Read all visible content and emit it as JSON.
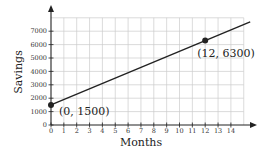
{
  "chart_data": {
    "type": "line",
    "title": "",
    "xlabel": "Months",
    "ylabel": "Savings",
    "xlim": [
      0,
      15
    ],
    "ylim": [
      0,
      8000
    ],
    "x_ticks": [
      0,
      1,
      2,
      3,
      4,
      5,
      6,
      7,
      8,
      9,
      10,
      11,
      12,
      13,
      14
    ],
    "y_ticks": [
      0,
      1000,
      2000,
      3000,
      4000,
      5000,
      6000,
      7000
    ],
    "grid": true,
    "legend": null,
    "series": [
      {
        "name": "Savings",
        "equation": "y = 400x + 1500",
        "x": [
          0,
          15.5
        ],
        "values": [
          1500,
          7700
        ]
      }
    ],
    "points": [
      {
        "x": 0,
        "y": 1500,
        "label": "(0, 1500)"
      },
      {
        "x": 12,
        "y": 6300,
        "label": "(12, 6300)"
      }
    ],
    "colors": {
      "line": "#222222",
      "grid": "#cccccc",
      "axis": "#222222"
    }
  }
}
